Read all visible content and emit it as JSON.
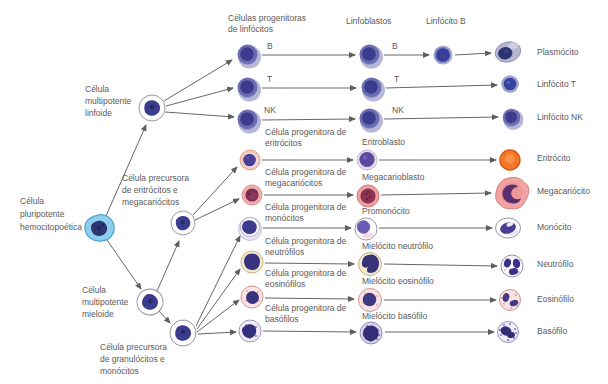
{
  "palette": {
    "text": "#5a5a5a",
    "arrow": "#666666",
    "lavender": "#b7b7d8",
    "purple_mid": "#6c6cb2",
    "purple_dark": "#3c3c8e",
    "navy": "#2c3472",
    "stem_blue": "#8fcdee",
    "stem_blue_edge": "#44a0cc",
    "erythrocyte_orange": "#f4772a",
    "erythrocyte_edge": "#dd5410",
    "mega_pink": "#f2a4a4",
    "mega_pink_edge": "#d97a7a",
    "plum": "#5c3070",
    "maroon": "#7c2d55",
    "cream": "#f5ecd0",
    "blush": "#f8e2e2"
  },
  "headers": {
    "progenitors": [
      "Células progenitoras",
      "de linfócitos"
    ],
    "lymphoblasts": "Linfoblastos",
    "lymphocyte_b": "Linfócito B"
  },
  "stem": {
    "pluripotent": [
      "Célula",
      "pluripotente",
      "hemocitopoética"
    ],
    "lymphoid": [
      "Célula",
      "multipotente",
      "linfoide"
    ],
    "myeloid": [
      "Célula",
      "multipotente",
      "mieloide"
    ],
    "erythro_mega": [
      "Célula precursora",
      "de eritrócitos e",
      "megacariócitos"
    ],
    "granulo_mono": [
      "Célula precursora",
      "de granulócitos e",
      "monócitos"
    ]
  },
  "rows": [
    {
      "letter": "B",
      "blast_letter": "B",
      "final": "Plasmócito"
    },
    {
      "letter": "T",
      "blast_letter": "T",
      "final": "Linfócito T"
    },
    {
      "letter": "NK",
      "blast_letter": "NK",
      "final": "Linfócito NK"
    },
    {
      "progenitor": [
        "Célula progenitora de",
        "eritrócitos"
      ],
      "blast": "Eritroblasto",
      "final": "Eritrócito"
    },
    {
      "progenitor": [
        "Célula progenitora de",
        "megacariócitos"
      ],
      "blast": "Megacarioblasto",
      "final": "Megacariócito"
    },
    {
      "progenitor": [
        "Célula progenitora de",
        "monócitos"
      ],
      "blast": "Promonócito",
      "final": "Monócito"
    },
    {
      "progenitor": [
        "Célula progenitora de",
        "neutrófilos"
      ],
      "blast": "Mielócito neutrófilo",
      "final": "Neutrófilo"
    },
    {
      "progenitor": [
        "Célula progenitora de",
        "eosinófilos"
      ],
      "blast": "Mielócito eosinófilo",
      "final": "Eosinófilo"
    },
    {
      "progenitor": [
        "Célula progenitora de",
        "basófilos"
      ],
      "blast": "Mielócito basófilo",
      "final": "Basófilo"
    }
  ]
}
